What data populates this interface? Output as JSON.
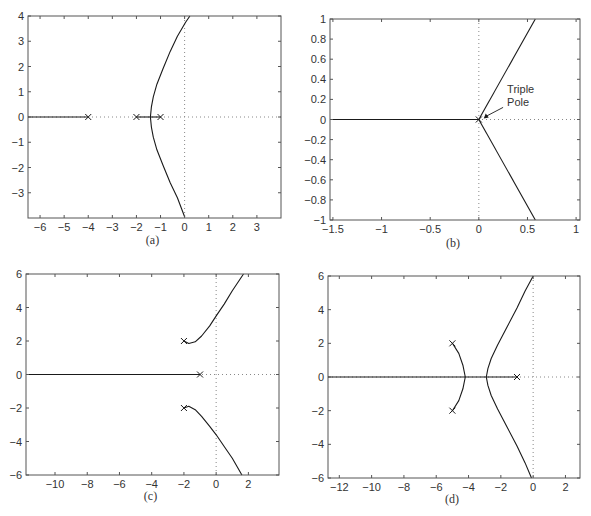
{
  "chart_data": [
    {
      "id": "a",
      "type": "line",
      "title": "Root locus (a)",
      "caption": "(a)",
      "xlabel": "",
      "ylabel": "",
      "xlim": [
        -6.5,
        4
      ],
      "ylim": [
        -4,
        4
      ],
      "xticks": [
        -6,
        -5,
        -4,
        -3,
        -2,
        -1,
        0,
        1,
        2,
        3
      ],
      "yticks": [
        -3,
        -2,
        -1,
        0,
        1,
        2,
        3,
        4
      ],
      "grid": false,
      "poles": [
        [
          -4,
          0
        ],
        [
          -2,
          0
        ],
        [
          -1,
          0
        ]
      ],
      "branches": [
        {
          "name": "real-axis left",
          "points": [
            [
              -6.5,
              0
            ],
            [
              -4,
              0
            ]
          ]
        },
        {
          "name": "real-axis segment",
          "points": [
            [
              -2,
              0
            ],
            [
              -1,
              0
            ]
          ]
        },
        {
          "name": "upper branch",
          "points": [
            [
              -1.42,
              0
            ],
            [
              -1.38,
              0.4
            ],
            [
              -1.3,
              0.8
            ],
            [
              -1.15,
              1.3
            ],
            [
              -0.9,
              1.9
            ],
            [
              -0.6,
              2.6
            ],
            [
              -0.3,
              3.2
            ],
            [
              0.04,
              3.75
            ],
            [
              0.22,
              4
            ]
          ]
        },
        {
          "name": "lower branch",
          "points": [
            [
              -1.42,
              0
            ],
            [
              -1.38,
              -0.4
            ],
            [
              -1.3,
              -0.8
            ],
            [
              -1.15,
              -1.3
            ],
            [
              -0.9,
              -1.9
            ],
            [
              -0.6,
              -2.6
            ],
            [
              -0.3,
              -3.2
            ],
            [
              0.0,
              -3.95
            ]
          ]
        }
      ],
      "annotations": []
    },
    {
      "id": "b",
      "type": "line",
      "title": "Root locus (b)",
      "caption": "(b)",
      "xlabel": "",
      "ylabel": "",
      "xlim": [
        -1.53,
        1.04
      ],
      "ylim": [
        -1,
        1
      ],
      "xticks": [
        -1.5,
        -1,
        -0.5,
        0,
        0.5,
        1
      ],
      "yticks": [
        -1,
        -0.8,
        -0.6,
        -0.4,
        -0.2,
        0,
        0.2,
        0.4,
        0.6,
        0.8,
        1
      ],
      "grid": false,
      "poles": [
        [
          0,
          0
        ]
      ],
      "branches": [
        {
          "name": "real-axis left",
          "points": [
            [
              -1.53,
              0
            ],
            [
              0,
              0
            ]
          ]
        },
        {
          "name": "upper branch",
          "points": [
            [
              0,
              0
            ],
            [
              0.58,
              1
            ]
          ]
        },
        {
          "name": "lower branch",
          "points": [
            [
              0,
              0
            ],
            [
              0.58,
              -1
            ]
          ]
        }
      ],
      "annotations": [
        {
          "text": [
            "Triple",
            "Pole"
          ],
          "arrow_to": [
            0.04,
            0.0
          ],
          "text_at": [
            0.27,
            0.2
          ]
        }
      ]
    },
    {
      "id": "c",
      "type": "line",
      "title": "Root locus (c)",
      "caption": "(c)",
      "xlabel": "",
      "ylabel": "",
      "xlim": [
        -11.8,
        3.9
      ],
      "ylim": [
        -6,
        6
      ],
      "xticks": [
        -10,
        -8,
        -6,
        -4,
        -2,
        0,
        2
      ],
      "yticks": [
        -6,
        -4,
        -2,
        0,
        2,
        4,
        6
      ],
      "grid": false,
      "poles": [
        [
          -2,
          2
        ],
        [
          -2,
          -2
        ],
        [
          -1,
          0
        ]
      ],
      "branches": [
        {
          "name": "real-axis",
          "points": [
            [
              -11.8,
              0
            ],
            [
              -1,
              0
            ]
          ]
        },
        {
          "name": "upper branch",
          "points": [
            [
              -2,
              2
            ],
            [
              -1.7,
              1.85
            ],
            [
              -1.3,
              1.95
            ],
            [
              -0.9,
              2.3
            ],
            [
              -0.4,
              2.9
            ],
            [
              0,
              3.5
            ],
            [
              0.5,
              4.2
            ],
            [
              1.0,
              5.0
            ],
            [
              1.7,
              6
            ]
          ]
        },
        {
          "name": "lower branch",
          "points": [
            [
              -2,
              -2
            ],
            [
              -1.7,
              -1.9
            ],
            [
              -1.3,
              -2.1
            ],
            [
              -0.9,
              -2.5
            ],
            [
              -0.4,
              -3.1
            ],
            [
              0,
              -3.6
            ],
            [
              0.5,
              -4.3
            ],
            [
              1.0,
              -5.0
            ],
            [
              1.6,
              -6
            ]
          ]
        }
      ],
      "annotations": []
    },
    {
      "id": "d",
      "type": "line",
      "title": "Root locus (d)",
      "caption": "(d)",
      "xlabel": "",
      "ylabel": "",
      "xlim": [
        -12.7,
        2.9
      ],
      "ylim": [
        -6,
        6
      ],
      "xticks": [
        -12,
        -10,
        -8,
        -6,
        -4,
        -2,
        0,
        2
      ],
      "yticks": [
        -6,
        -4,
        -2,
        0,
        2,
        4,
        6
      ],
      "grid": false,
      "poles": [
        [
          -5,
          2
        ],
        [
          -5,
          -2
        ],
        [
          -1,
          0
        ]
      ],
      "branches": [
        {
          "name": "real-axis",
          "points": [
            [
              -12.7,
              0
            ],
            [
              -1,
              0
            ]
          ]
        },
        {
          "name": "inner upper",
          "points": [
            [
              -5,
              2
            ],
            [
              -4.6,
              1.4
            ],
            [
              -4.35,
              0.7
            ],
            [
              -4.2,
              0
            ]
          ]
        },
        {
          "name": "inner lower",
          "points": [
            [
              -5,
              -2
            ],
            [
              -4.6,
              -1.4
            ],
            [
              -4.35,
              -0.7
            ],
            [
              -4.2,
              0
            ]
          ]
        },
        {
          "name": "outer upper",
          "points": [
            [
              -2.9,
              0
            ],
            [
              -2.8,
              0.5
            ],
            [
              -2.6,
              1.1
            ],
            [
              -2.2,
              1.9
            ],
            [
              -1.6,
              3.0
            ],
            [
              -1.0,
              4.1
            ],
            [
              -0.5,
              5.1
            ],
            [
              0,
              6
            ]
          ]
        },
        {
          "name": "outer lower",
          "points": [
            [
              -2.9,
              0
            ],
            [
              -2.8,
              -0.5
            ],
            [
              -2.6,
              -1.1
            ],
            [
              -2.2,
              -1.9
            ],
            [
              -1.6,
              -3.0
            ],
            [
              -1.0,
              -4.1
            ],
            [
              -0.5,
              -5.1
            ],
            [
              -0.1,
              -6
            ]
          ]
        }
      ],
      "annotations": []
    }
  ],
  "panels": {
    "a": {
      "caption": "(a)"
    },
    "b": {
      "caption": "(b)",
      "annotation_line1": "Triple",
      "annotation_line2": "Pole"
    },
    "c": {
      "caption": "(c)"
    },
    "d": {
      "caption": "(d)"
    }
  },
  "layout": {
    "a": {
      "left": 28,
      "top": 16,
      "right": 281,
      "bottom": 218,
      "caption_y": 244
    },
    "b": {
      "left": 330,
      "top": 19,
      "right": 580,
      "bottom": 220,
      "caption_y": 247
    },
    "c": {
      "left": 26,
      "top": 274,
      "right": 279,
      "bottom": 475,
      "caption_y": 500
    },
    "d": {
      "left": 328,
      "top": 276,
      "right": 580,
      "bottom": 478,
      "caption_y": 503
    }
  },
  "colors": {
    "line": "#1a1a1a",
    "frame": "#555555",
    "dotted": "#888888",
    "text": "#333333"
  }
}
